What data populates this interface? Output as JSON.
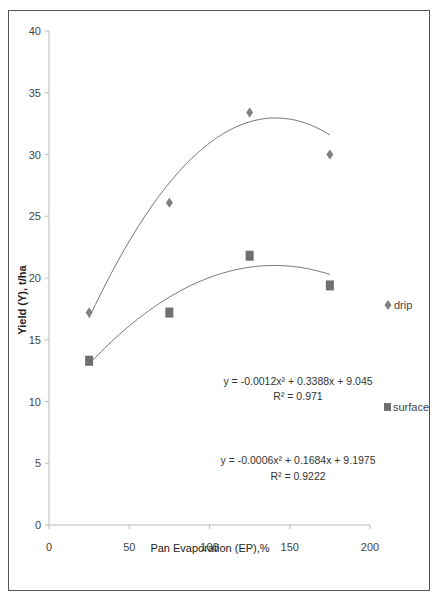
{
  "chart_data": {
    "type": "scatter",
    "title": "",
    "xlabel": "Pan Evaporation (EP),%",
    "ylabel": "Yield (Y), t/ha",
    "xlim": [
      0,
      200
    ],
    "ylim": [
      0,
      40
    ],
    "x_ticks": [
      0,
      50,
      100,
      150,
      200
    ],
    "y_ticks": [
      0,
      5,
      10,
      15,
      20,
      25,
      30,
      35,
      40
    ],
    "grid": false,
    "legend_position": "right",
    "series": [
      {
        "name": "drip",
        "marker": "diamond",
        "color": "#808080",
        "x": [
          25,
          75,
          125,
          175
        ],
        "values": [
          17.2,
          26.1,
          33.4,
          30.0
        ],
        "trendline": {
          "type": "polynomial",
          "order": 2,
          "a": -0.0012,
          "b": 0.3388,
          "c": 9.045,
          "equation": "y = -0.0012x² + 0.3388x + 9.045",
          "r2": "R² = 0.971"
        }
      },
      {
        "name": "surface",
        "marker": "square",
        "color": "#707070",
        "x": [
          25,
          75,
          125,
          175
        ],
        "values": [
          13.3,
          17.2,
          21.8,
          19.4
        ],
        "trendline": {
          "type": "polynomial",
          "order": 2,
          "a": -0.0006,
          "b": 0.1684,
          "c": 9.1975,
          "equation": "y = -0.0006x² + 0.1684x + 9.1975",
          "r2": "R² = 0.9222"
        }
      }
    ]
  },
  "legend": {
    "drip_label": "drip",
    "surface_label": "surface"
  },
  "annotations": {
    "drip_equation": "y = -0.0012x² + 0.3388x + 9.045",
    "drip_r2": "R² = 0.971",
    "surface_equation": "y = -0.0006x² + 0.1684x + 9.1975",
    "surface_r2": "R² = 0.9222"
  },
  "axes": {
    "x_title": "Pan Evaporation (EP),%",
    "y_title": "Yield (Y), t/ha",
    "x_tick_labels": [
      "0",
      "50",
      "100",
      "150",
      "200"
    ],
    "y_tick_labels": [
      "0",
      "5",
      "10",
      "15",
      "20",
      "25",
      "30",
      "35",
      "40"
    ]
  }
}
